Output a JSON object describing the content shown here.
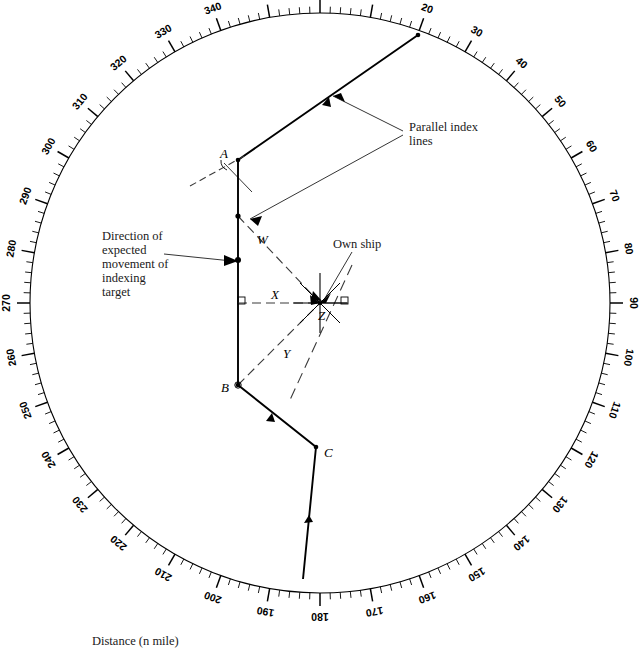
{
  "figure": {
    "caption": "Distance (n mile)",
    "background_color": "#ffffff",
    "ink_color": "#000000"
  },
  "compass_ring": {
    "unit": "degrees",
    "label_interval": 10,
    "minor_tick_interval": 2,
    "labels": [
      "0",
      "10",
      "20",
      "30",
      "40",
      "50",
      "60",
      "70",
      "80",
      "90",
      "100",
      "110",
      "120",
      "130",
      "140",
      "150",
      "160",
      "170",
      "180",
      "190",
      "200",
      "210",
      "220",
      "230",
      "240",
      "250",
      "260",
      "270",
      "280",
      "290",
      "300",
      "310",
      "320",
      "330",
      "340",
      "350"
    ]
  },
  "annotations": {
    "parallel_index_lines": {
      "line1": "Parallel index",
      "line2": "lines"
    },
    "direction_of_movement": {
      "line1": "Direction of",
      "line2": "expected",
      "line3": "movement of",
      "line4": "indexing",
      "line5": "target"
    },
    "own_ship": "Own ship"
  },
  "points": [
    {
      "id": "A",
      "label": "A"
    },
    {
      "id": "B",
      "label": "B"
    },
    {
      "id": "C",
      "label": "C"
    },
    {
      "id": "Z",
      "label": "Z"
    }
  ],
  "segments": [
    {
      "id": "W",
      "label": "W",
      "style": "dashed",
      "from": "index-line-1",
      "to": "Z"
    },
    {
      "id": "X",
      "label": "X",
      "style": "dashed",
      "from": "index-line-2",
      "to": "Z"
    },
    {
      "id": "Y",
      "label": "Y",
      "style": "dashed",
      "from": "B",
      "to": "Z"
    }
  ],
  "chart_data": {
    "type": "scatter",
    "xlabel": "Distance (n mile)",
    "ylabel": "",
    "coordinate_system": "polar-compass",
    "center": {
      "x": 320,
      "y": 303,
      "label": "Own ship (Z)"
    },
    "ring_radius_px": 290,
    "ring_bearing_range": [
      0,
      360
    ],
    "track_vertices": [
      {
        "name": "entry",
        "bearing_deg": 20,
        "x": 418,
        "y": 35
      },
      {
        "name": "A",
        "bearing_deg": 337,
        "x": 238,
        "y": 160
      },
      {
        "name": "bend1",
        "bearing_deg": 270,
        "x": 238,
        "y": 303
      },
      {
        "name": "B",
        "bearing_deg": 243,
        "x": 238,
        "y": 385
      },
      {
        "name": "C",
        "bearing_deg": 200,
        "x": 316,
        "y": 447
      },
      {
        "name": "exit",
        "bearing_deg": 186,
        "x": 303,
        "y": 579
      }
    ],
    "index_lines": [
      {
        "name": "W",
        "from": [
          238,
          216
        ],
        "to": [
          320,
          303
        ]
      },
      {
        "name": "X",
        "from": [
          238,
          303
        ],
        "to": [
          320,
          303
        ]
      },
      {
        "name": "Y",
        "from": [
          238,
          385
        ],
        "to": [
          320,
          303
        ]
      }
    ],
    "grid": false,
    "legend": "none"
  }
}
